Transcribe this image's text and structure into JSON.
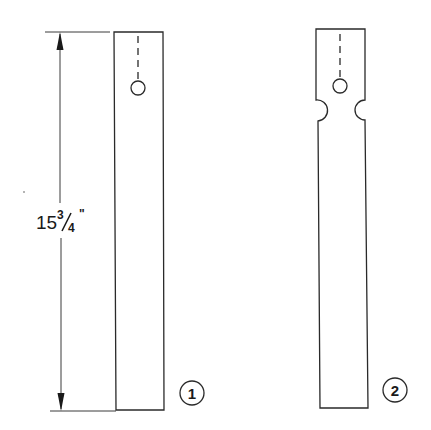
{
  "diagram": {
    "dimension": {
      "whole": "15",
      "numerator": "3",
      "denominator": "4",
      "unit_mark": "\"",
      "label": "15 3/4\""
    },
    "parts": [
      {
        "id": "part-1",
        "label": "1",
        "description": "Plain strip with hole near top"
      },
      {
        "id": "part-2",
        "label": "2",
        "description": "Strip with hole and side notches near top"
      }
    ],
    "colors": {
      "line": "#2a2a2a",
      "background": "#ffffff"
    }
  }
}
